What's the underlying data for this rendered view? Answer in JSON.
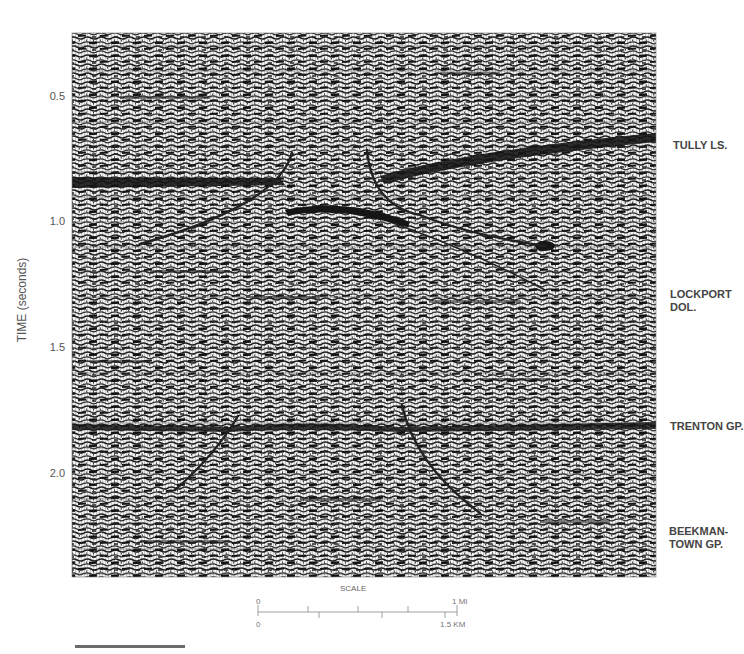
{
  "figure": {
    "type": "seismic-reflection-section",
    "y_axis": {
      "label": "TIME (seconds)",
      "ticks": [
        {
          "value": "0.5",
          "y": 97
        },
        {
          "value": "1.0",
          "y": 222
        },
        {
          "value": "1.5",
          "y": 348
        },
        {
          "value": "2.0",
          "y": 474
        }
      ]
    },
    "formations": [
      {
        "label": "TULLY LS.",
        "y": 140
      },
      {
        "label": "LOCKPORT",
        "label2": "DOL.",
        "y": 287
      },
      {
        "label": "TRENTON GP.",
        "y": 420
      },
      {
        "label": "BEEKMAN-",
        "label2": "TOWN GP.",
        "y": 524
      }
    ],
    "scale": {
      "title": "SCALE",
      "top_start": "0",
      "top_end": "1 MI",
      "bottom_start": "0",
      "bottom_end": "1.5 KM"
    },
    "colors": {
      "trace_dark": "#1a1a1a",
      "trace_light": "#f4f4f4",
      "interpretation": "#262626",
      "grid": "#5a5a5a"
    }
  }
}
